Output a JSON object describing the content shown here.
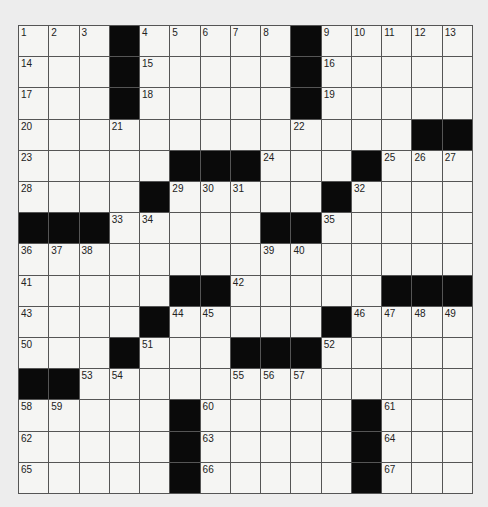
{
  "puzzle": {
    "rows": 15,
    "cols": 15,
    "colors": {
      "block": "#0a0a0a",
      "cell": "#f5f5f3",
      "line": "#555555"
    },
    "grid": [
      "...#.....#.....",
      "...#.....#.....",
      "...#.....#.....",
      ".............##",
      ".....###...#...",
      "....#.....#....",
      "###.....##.....",
      "...............",
      ".....##.....###",
      "....#.....#....",
      "...#...###.....",
      "##.............",
      ".....#.....#...",
      ".....#.....#...",
      ".....#.....#..."
    ],
    "numbers": [
      [
        1,
        2,
        3,
        0,
        4,
        5,
        6,
        7,
        8,
        0,
        9,
        10,
        11,
        12,
        13
      ],
      [
        14,
        0,
        0,
        0,
        15,
        0,
        0,
        0,
        0,
        0,
        16,
        0,
        0,
        0,
        0
      ],
      [
        17,
        0,
        0,
        0,
        18,
        0,
        0,
        0,
        0,
        0,
        19,
        0,
        0,
        0,
        0
      ],
      [
        20,
        0,
        0,
        21,
        0,
        0,
        0,
        0,
        0,
        22,
        0,
        0,
        0,
        0,
        0
      ],
      [
        23,
        0,
        0,
        0,
        0,
        0,
        0,
        0,
        24,
        0,
        0,
        0,
        25,
        26,
        27
      ],
      [
        28,
        0,
        0,
        0,
        0,
        29,
        30,
        31,
        0,
        0,
        0,
        32,
        0,
        0,
        0
      ],
      [
        0,
        0,
        0,
        33,
        34,
        0,
        0,
        0,
        0,
        0,
        35,
        0,
        0,
        0,
        0
      ],
      [
        36,
        37,
        38,
        0,
        0,
        0,
        0,
        0,
        39,
        40,
        0,
        0,
        0,
        0,
        0
      ],
      [
        41,
        0,
        0,
        0,
        0,
        0,
        0,
        42,
        0,
        0,
        0,
        0,
        0,
        0,
        0
      ],
      [
        43,
        0,
        0,
        0,
        0,
        44,
        45,
        0,
        0,
        0,
        0,
        46,
        47,
        48,
        49
      ],
      [
        50,
        0,
        0,
        0,
        51,
        0,
        0,
        0,
        0,
        0,
        52,
        0,
        0,
        0,
        0
      ],
      [
        0,
        0,
        53,
        54,
        0,
        0,
        0,
        55,
        56,
        57,
        0,
        0,
        0,
        0,
        0
      ],
      [
        58,
        59,
        0,
        0,
        0,
        0,
        60,
        0,
        0,
        0,
        0,
        0,
        61,
        0,
        0
      ],
      [
        62,
        0,
        0,
        0,
        0,
        0,
        63,
        0,
        0,
        0,
        0,
        0,
        64,
        0,
        0
      ],
      [
        65,
        0,
        0,
        0,
        0,
        0,
        66,
        0,
        0,
        0,
        0,
        0,
        67,
        0,
        0
      ]
    ]
  }
}
